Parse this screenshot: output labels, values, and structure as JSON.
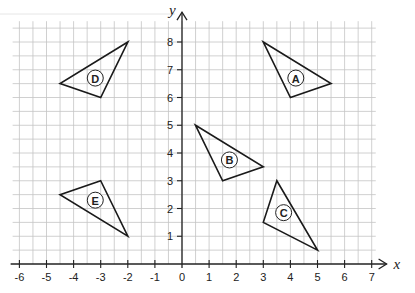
{
  "diagram": {
    "type": "coordinate-grid",
    "axes": {
      "x_label": "x",
      "y_label": "y",
      "x_ticks": [
        -6,
        -5,
        -4,
        -3,
        -2,
        -1,
        0,
        1,
        2,
        3,
        4,
        5,
        6,
        7
      ],
      "y_ticks": [
        1,
        2,
        3,
        4,
        5,
        6,
        7,
        8
      ],
      "x_range": [
        -6.25,
        7.15
      ],
      "y_range": [
        0,
        8.75
      ],
      "grid_step": 0.5
    },
    "triangles": [
      {
        "label": "A",
        "vertices": [
          [
            3,
            8
          ],
          [
            5.5,
            6.5
          ],
          [
            4,
            6
          ]
        ],
        "label_pos": [
          4.2,
          6.7
        ]
      },
      {
        "label": "B",
        "vertices": [
          [
            0.5,
            5
          ],
          [
            3,
            3.5
          ],
          [
            1.5,
            3
          ]
        ],
        "label_pos": [
          1.75,
          3.75
        ]
      },
      {
        "label": "C",
        "vertices": [
          [
            3.5,
            3
          ],
          [
            5,
            0.5
          ],
          [
            3,
            1.5
          ]
        ],
        "label_pos": [
          3.75,
          1.85
        ]
      },
      {
        "label": "D",
        "vertices": [
          [
            -2,
            8
          ],
          [
            -4.5,
            6.5
          ],
          [
            -3,
            6
          ]
        ],
        "label_pos": [
          -3.2,
          6.7
        ]
      },
      {
        "label": "E",
        "vertices": [
          [
            -3,
            3
          ],
          [
            -2,
            1
          ],
          [
            -4.5,
            2.5
          ]
        ],
        "label_pos": [
          -3.2,
          2.3
        ]
      }
    ],
    "colors": {
      "grid": "#c4c4c4",
      "axis": "#222222",
      "shape": "#1a1a1a",
      "background": "#ffffff"
    }
  }
}
